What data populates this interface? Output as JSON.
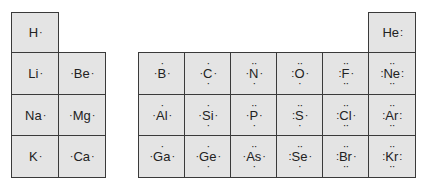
{
  "elements": [
    {
      "id": "H",
      "symbol": "H",
      "left": "",
      "right": "·",
      "top": "",
      "bottom": "",
      "col": 0,
      "row": 0
    },
    {
      "id": "He",
      "symbol": "He",
      "left": "",
      "right": ":",
      "top": "",
      "bottom": "",
      "col": 7,
      "row": 0
    },
    {
      "id": "Li",
      "symbol": "Li",
      "left": "",
      "right": "·",
      "top": "",
      "bottom": "",
      "col": 0,
      "row": 1
    },
    {
      "id": "Be",
      "symbol": "Be",
      "left": "·",
      "right": "·",
      "top": "",
      "bottom": "",
      "col": 1,
      "row": 1
    },
    {
      "id": "B",
      "symbol": "B",
      "left": "·",
      "right": "·",
      "top": "·",
      "bottom": "",
      "col": 2,
      "row": 1
    },
    {
      "id": "C",
      "symbol": "C",
      "left": "·",
      "right": "·",
      "top": "·",
      "bottom": "·",
      "col": 3,
      "row": 1
    },
    {
      "id": "N",
      "symbol": "N",
      "left": "·",
      "right": "·",
      "top": "··",
      "bottom": "·",
      "col": 4,
      "row": 1
    },
    {
      "id": "O",
      "symbol": "O",
      "left": ":",
      "right": "·",
      "top": "··",
      "bottom": "·",
      "col": 5,
      "row": 1
    },
    {
      "id": "F",
      "symbol": "F",
      "left": ":",
      "right": "·",
      "top": "··",
      "bottom": "··",
      "col": 6,
      "row": 1
    },
    {
      "id": "Ne",
      "symbol": "Ne",
      "left": ":",
      "right": ":",
      "top": "··",
      "bottom": "··",
      "col": 7,
      "row": 1
    },
    {
      "id": "Na",
      "symbol": "Na",
      "left": "",
      "right": "·",
      "top": "",
      "bottom": "",
      "col": 0,
      "row": 2
    },
    {
      "id": "Mg",
      "symbol": "Mg",
      "left": "·",
      "right": "·",
      "top": "",
      "bottom": "",
      "col": 1,
      "row": 2
    },
    {
      "id": "Al",
      "symbol": "Al",
      "left": "·",
      "right": "·",
      "top": "·",
      "bottom": "",
      "col": 2,
      "row": 2
    },
    {
      "id": "Si",
      "symbol": "Si",
      "left": "·",
      "right": "·",
      "top": "·",
      "bottom": "·",
      "col": 3,
      "row": 2
    },
    {
      "id": "P",
      "symbol": "P",
      "left": "·",
      "right": "·",
      "top": "··",
      "bottom": "·",
      "col": 4,
      "row": 2
    },
    {
      "id": "S",
      "symbol": "S",
      "left": ":",
      "right": "·",
      "top": "··",
      "bottom": "·",
      "col": 5,
      "row": 2
    },
    {
      "id": "Cl",
      "symbol": "Cl",
      "left": ":",
      "right": "·",
      "top": "··",
      "bottom": "··",
      "col": 6,
      "row": 2
    },
    {
      "id": "Ar",
      "symbol": "Ar",
      "left": ":",
      "right": ":",
      "top": "··",
      "bottom": "··",
      "col": 7,
      "row": 2
    },
    {
      "id": "K",
      "symbol": "K",
      "left": "",
      "right": "·",
      "top": "",
      "bottom": "",
      "col": 0,
      "row": 3
    },
    {
      "id": "Ca",
      "symbol": "Ca",
      "left": "·",
      "right": "·",
      "top": "",
      "bottom": "",
      "col": 1,
      "row": 3
    },
    {
      "id": "Ga",
      "symbol": "Ga",
      "left": "·",
      "right": "·",
      "top": "·",
      "bottom": "",
      "col": 2,
      "row": 3
    },
    {
      "id": "Ge",
      "symbol": "Ge",
      "left": "·",
      "right": "·",
      "top": "·",
      "bottom": "·",
      "col": 3,
      "row": 3
    },
    {
      "id": "As",
      "symbol": "As",
      "left": "·",
      "right": "·",
      "top": "··",
      "bottom": "·",
      "col": 4,
      "row": 3
    },
    {
      "id": "Se",
      "symbol": "Se",
      "left": ":",
      "right": "·",
      "top": "··",
      "bottom": "·",
      "col": 5,
      "row": 3
    },
    {
      "id": "Br",
      "symbol": "Br",
      "left": ":",
      "right": "·",
      "top": "··",
      "bottom": "··",
      "col": 6,
      "row": 3
    },
    {
      "id": "Kr",
      "symbol": "Kr",
      "left": ":",
      "right": ":",
      "top": "··",
      "bottom": "··",
      "col": 7,
      "row": 3
    }
  ],
  "layout": {
    "col_x": [
      11,
      58,
      138,
      184,
      230,
      276,
      322,
      368
    ],
    "col_w": 46,
    "row_y": [
      12,
      52,
      94,
      135
    ],
    "row_h": [
      40,
      42,
      41,
      41
    ],
    "cell_bg": "#e4e4e4",
    "border": "#3a3a3a"
  }
}
